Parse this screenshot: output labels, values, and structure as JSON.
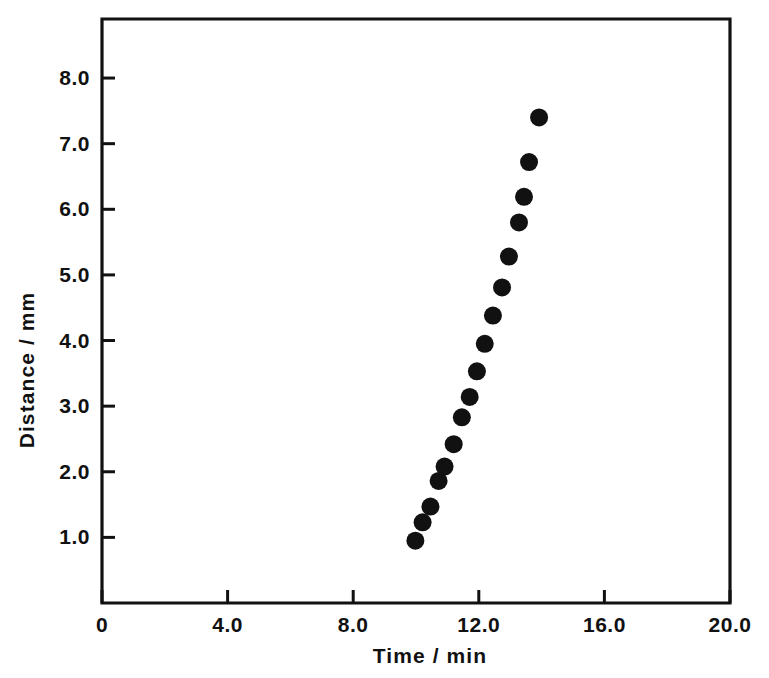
{
  "chart_data": {
    "type": "scatter",
    "title": "",
    "xlabel": "Time / min",
    "ylabel": "Distance / mm",
    "xlim": [
      0,
      20
    ],
    "ylim": [
      0,
      8.9
    ],
    "grid": false,
    "legend": null,
    "x_ticks": [
      {
        "value": 0,
        "label": "0"
      },
      {
        "value": 4,
        "label": "4.0"
      },
      {
        "value": 8,
        "label": "8.0"
      },
      {
        "value": 12,
        "label": "12.0"
      },
      {
        "value": 16,
        "label": "16.0"
      },
      {
        "value": 20,
        "label": "20.0"
      }
    ],
    "y_ticks": [
      {
        "value": 1,
        "label": "1.0"
      },
      {
        "value": 2,
        "label": "2.0"
      },
      {
        "value": 3,
        "label": "3.0"
      },
      {
        "value": 4,
        "label": "4.0"
      },
      {
        "value": 5,
        "label": "5.0"
      },
      {
        "value": 6,
        "label": "6.0"
      },
      {
        "value": 7,
        "label": "7.0"
      },
      {
        "value": 8,
        "label": "8.0"
      }
    ],
    "marker": {
      "shape": "circle",
      "color": "#111111",
      "radius_px": 9
    },
    "series": [
      {
        "name": "distance vs time",
        "x": [
          9.98,
          10.21,
          10.46,
          10.72,
          10.91,
          11.2,
          11.46,
          11.71,
          11.94,
          12.19,
          12.45,
          12.74,
          12.96,
          13.28,
          13.44,
          13.6,
          13.92
        ],
        "y": [
          0.95,
          1.23,
          1.47,
          1.86,
          2.08,
          2.42,
          2.83,
          3.14,
          3.53,
          3.95,
          4.38,
          4.81,
          5.28,
          5.8,
          6.19,
          6.72,
          7.4
        ]
      }
    ]
  },
  "colors": {
    "ink": "#111111",
    "background": "#ffffff"
  }
}
